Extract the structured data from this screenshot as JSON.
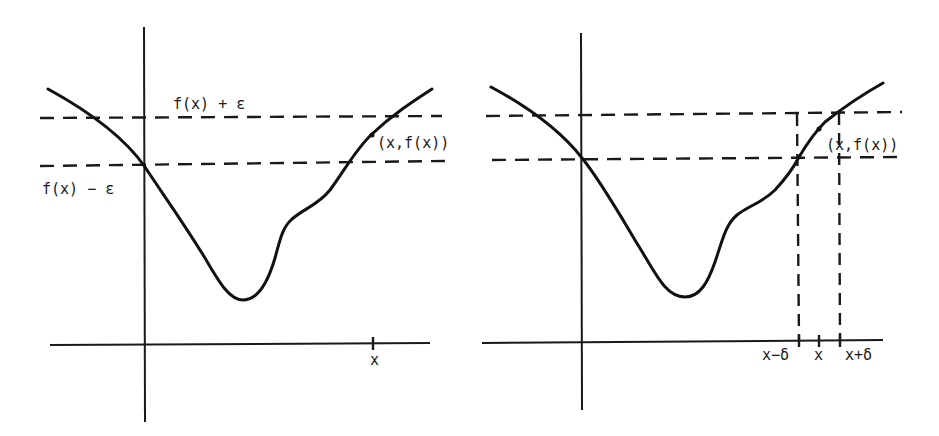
{
  "figure": {
    "panels": [
      {
        "id": "left",
        "labels": {
          "upper_band": "f(x) + ε",
          "lower_band": "f(x) − ε",
          "point": "(x,f(x))",
          "x_tick": "x"
        }
      },
      {
        "id": "right",
        "labels": {
          "point": "(x,f(x))",
          "x_minus_delta": "x−δ",
          "x_tick": "x",
          "x_plus_delta": "x+δ"
        }
      }
    ],
    "colors": {
      "ink": "#1a1a1a",
      "background": "#ffffff"
    }
  }
}
